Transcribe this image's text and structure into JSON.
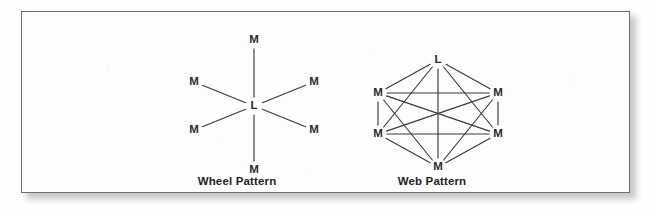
{
  "figure": {
    "background_color": "#fefefe",
    "frame_border_color": "#6e6e6e",
    "line_color": "#3a3a3a",
    "label_color": "#2b2b2b"
  },
  "diagrams": [
    {
      "id": "wheel-pattern",
      "caption": "Wheel Pattern",
      "type": "star-graph",
      "center_node": {
        "label": "L",
        "x": 132,
        "y": 94
      },
      "outer_nodes": [
        {
          "label": "M",
          "x": 132,
          "y": 28,
          "position": "top"
        },
        {
          "label": "M",
          "x": 72,
          "y": 70,
          "position": "upper-left"
        },
        {
          "label": "M",
          "x": 192,
          "y": 70,
          "position": "upper-right"
        },
        {
          "label": "M",
          "x": 72,
          "y": 118,
          "position": "lower-left"
        },
        {
          "label": "M",
          "x": 192,
          "y": 118,
          "position": "lower-right"
        },
        {
          "label": "M",
          "x": 132,
          "y": 158,
          "position": "bottom"
        }
      ]
    },
    {
      "id": "web-pattern",
      "caption": "Web Pattern",
      "type": "complete-graph",
      "nodes": [
        {
          "label": "L",
          "x": 126,
          "y": 48,
          "position": "top"
        },
        {
          "label": "M",
          "x": 66,
          "y": 81,
          "position": "upper-left"
        },
        {
          "label": "M",
          "x": 186,
          "y": 81,
          "position": "upper-right"
        },
        {
          "label": "M",
          "x": 66,
          "y": 122,
          "position": "lower-left"
        },
        {
          "label": "M",
          "x": 186,
          "y": 122,
          "position": "lower-right"
        },
        {
          "label": "M",
          "x": 126,
          "y": 155,
          "position": "bottom"
        }
      ],
      "edges": [
        [
          0,
          1
        ],
        [
          0,
          2
        ],
        [
          0,
          3
        ],
        [
          0,
          4
        ],
        [
          0,
          5
        ],
        [
          1,
          2
        ],
        [
          1,
          3
        ],
        [
          1,
          4
        ],
        [
          1,
          5
        ],
        [
          2,
          3
        ],
        [
          2,
          4
        ],
        [
          2,
          5
        ],
        [
          3,
          4
        ],
        [
          3,
          5
        ],
        [
          4,
          5
        ]
      ]
    }
  ]
}
